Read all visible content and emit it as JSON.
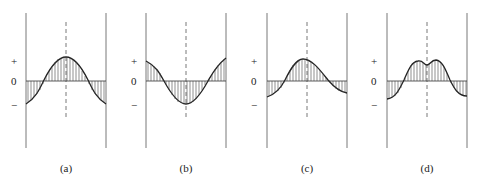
{
  "figure": {
    "axis_marks": {
      "plus": "+",
      "zero": "0",
      "minus": "−"
    },
    "panels": [
      {
        "id": "a",
        "label": "(a)",
        "shape": "single-peak-symmetric",
        "x_left": 26,
        "x_right": 106,
        "x_center": 66
      },
      {
        "id": "b",
        "label": "(b)",
        "shape": "single-trough-symmetric",
        "x_left": 146,
        "x_right": 226,
        "x_center": 186
      },
      {
        "id": "c",
        "label": "(c)",
        "shape": "single-peak-skewed-left",
        "x_left": 267,
        "x_right": 347,
        "x_center": 307
      },
      {
        "id": "d",
        "label": "(d)",
        "shape": "double-peak-symmetric",
        "x_left": 387,
        "x_right": 467,
        "x_center": 427
      }
    ]
  }
}
